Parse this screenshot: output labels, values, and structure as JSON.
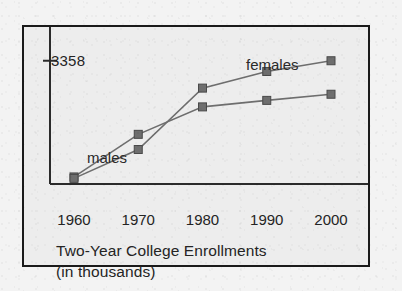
{
  "figure": {
    "caption_line1": "Two-Year College Enrollments",
    "caption_line2": "(in thousands)",
    "frame_color": "#1a1a1a",
    "background_color": "#ededed"
  },
  "chart_data": {
    "type": "line",
    "title": "Two-Year College Enrollments",
    "subtitle": "(in thousands)",
    "xlabel": "",
    "ylabel": "",
    "categories": [
      "1960",
      "1970",
      "1980",
      "1990",
      "2000"
    ],
    "x": [
      1960,
      1970,
      1980,
      1990,
      2000
    ],
    "series": [
      {
        "name": "males",
        "label": "males",
        "color": "#6e6e6e",
        "marker": "square",
        "values": [
          140,
          1320,
          2080,
          2260,
          2430
        ]
      },
      {
        "name": "females",
        "label": "females",
        "color": "#6e6e6e",
        "marker": "square",
        "values": [
          100,
          900,
          2600,
          3060,
          3358
        ]
      }
    ],
    "yticks": [
      {
        "label": "3358",
        "value": 3358
      }
    ],
    "ylim": [
      0,
      3600
    ],
    "grid": false,
    "legend": "inline-annotations",
    "annotations": [
      {
        "text": "males",
        "x": 1962,
        "y": 1450
      },
      {
        "text": "females",
        "x": 1988,
        "y": 3500
      }
    ]
  },
  "axis": {
    "y_tick_label": "3358",
    "x_tick_labels": [
      "1960",
      "1970",
      "1980",
      "1990",
      "2000"
    ],
    "axis_color": "#2b2b2b"
  },
  "labels": {
    "males": "males",
    "females": "females"
  }
}
